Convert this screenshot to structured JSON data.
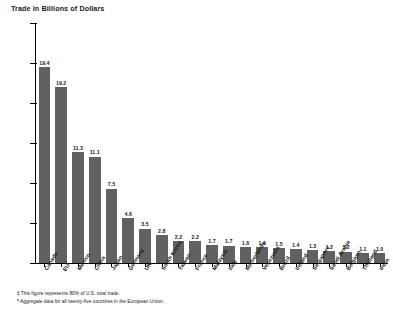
{
  "chart_data": {
    "type": "bar",
    "title": "Trade in Billions of Dollars",
    "xlabel": "",
    "ylabel": "Trade in Billions of Dollars",
    "ylim": [
      0,
      600
    ],
    "ytick_step": 100,
    "ytick_labels": [
      "600",
      "500",
      "400",
      "300",
      "200",
      "100",
      "0"
    ],
    "grid": false,
    "legend": "none",
    "categories": [
      "Canada",
      "EU",
      "Mexico",
      "China",
      "Japan",
      "Germany",
      "UK",
      "South Korea",
      "Taiwan",
      "France",
      "Malaysia",
      "Italy",
      "Netherlands",
      "Venezuela",
      "Brazil",
      "Ireland",
      "Singapore",
      "Saudi Arabia",
      "Belgium",
      "Thailand",
      "India"
    ],
    "category_footnote_marks": [
      "",
      "*",
      "",
      "",
      "",
      "",
      "",
      "",
      "",
      "",
      "",
      "",
      "",
      "",
      "",
      "",
      "",
      "",
      "",
      "",
      ""
    ],
    "values": [
      490,
      440,
      277,
      266,
      186,
      112,
      86,
      69,
      55,
      54,
      44,
      43,
      40,
      39,
      37,
      34,
      32,
      30,
      28,
      25,
      24
    ],
    "data_labels": [
      "19.4",
      "19.2",
      "11.3",
      "11.1",
      "7.5",
      "4.6",
      "3.5",
      "2.8",
      "2.2",
      "2.2",
      "1.7",
      "1.7",
      "1.6",
      "1.6",
      "1.5",
      "1.4",
      "1.3",
      "1.2",
      "1.2",
      "1.1",
      "1.0"
    ],
    "data_label_units": "percent share of U.S. total trade",
    "bar_color": "#616161",
    "axis_color": "#000000",
    "background_color": "#ffffff"
  },
  "footnotes": [
    {
      "mark": "‡",
      "text": "This figure represents 80% of U.S. total trade."
    },
    {
      "mark": "*",
      "text": "Aggregate data for all twenty-five countries in the European Union."
    }
  ]
}
